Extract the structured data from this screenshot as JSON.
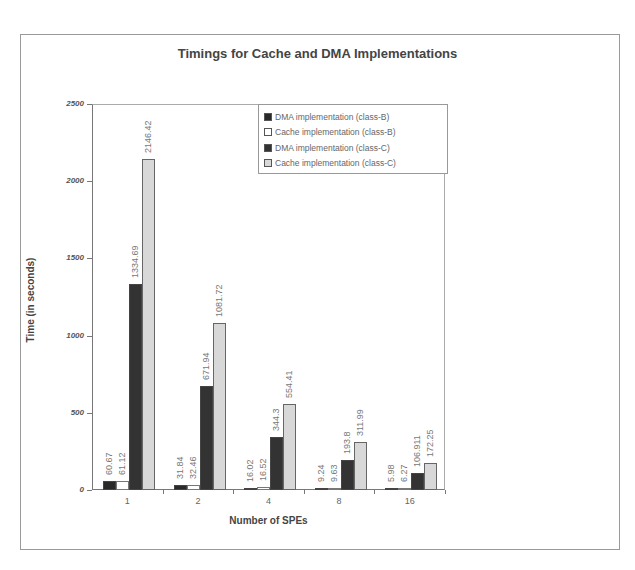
{
  "chart_data": {
    "type": "bar",
    "title": "Timings for Cache and DMA Implementations",
    "xlabel": "Number of SPEs",
    "ylabel": "Time (in seconds)",
    "ylim": [
      0,
      2500
    ],
    "yticks": [
      "0",
      "500",
      "1000",
      "1500",
      "2000",
      "2500"
    ],
    "categories": [
      "1",
      "2",
      "4",
      "8",
      "16"
    ],
    "grid": false,
    "legend_position": "top-right inside",
    "series": [
      {
        "name": "DMA implementation (class-B)",
        "color": "#2a2a2a",
        "values": [
          60.67,
          31.84,
          16.02,
          9.24,
          5.98
        ],
        "labels": [
          "60.67",
          "31.84",
          "16.02",
          "9.24",
          "5.98"
        ]
      },
      {
        "name": "Cache implementation (class-B)",
        "color": "#ffffff",
        "values": [
          61.12,
          32.46,
          16.52,
          9.63,
          6.27
        ],
        "labels": [
          "61.12",
          "32.46",
          "16.52",
          "9.63",
          "6.27"
        ]
      },
      {
        "name": "DMA implementation (class-C)",
        "color": "#333333",
        "values": [
          1334.69,
          671.94,
          344.3,
          193.8,
          106.911
        ],
        "labels": [
          "1334.69",
          "671.94",
          "344.3",
          "193.8",
          "106.911"
        ]
      },
      {
        "name": "Cache implementation (class-C)",
        "color": "#d8d8d8",
        "values": [
          2146.42,
          1081.72,
          554.41,
          311.99,
          172.25
        ],
        "labels": [
          "2146.42",
          "1081.72",
          "554.41",
          "311.99",
          "172.25"
        ]
      }
    ]
  }
}
